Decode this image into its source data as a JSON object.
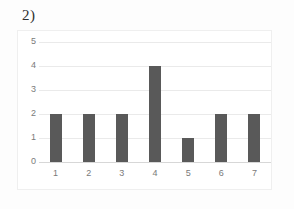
{
  "question_label": "2)",
  "colors": {
    "bar": "#595959",
    "gridline": "#eaeaea",
    "axis": "#d7d7d7",
    "tick_text": "#7a7a7a",
    "frame_border": "#efefef",
    "page_background": "#fdfdfd"
  },
  "chart_data": {
    "type": "bar",
    "title": "",
    "xlabel": "",
    "ylabel": "",
    "categories": [
      "1",
      "2",
      "3",
      "4",
      "5",
      "6",
      "7"
    ],
    "values": [
      2,
      2,
      2,
      4,
      1,
      2,
      2
    ],
    "ylim": [
      0,
      5
    ],
    "ytick_labels": [
      "5",
      "4",
      "3",
      "2",
      "1",
      "0"
    ],
    "ytick_values": [
      5,
      4,
      3,
      2,
      1,
      0
    ],
    "ystep": 1,
    "grid": true,
    "legend": false,
    "legend_position": "none"
  }
}
